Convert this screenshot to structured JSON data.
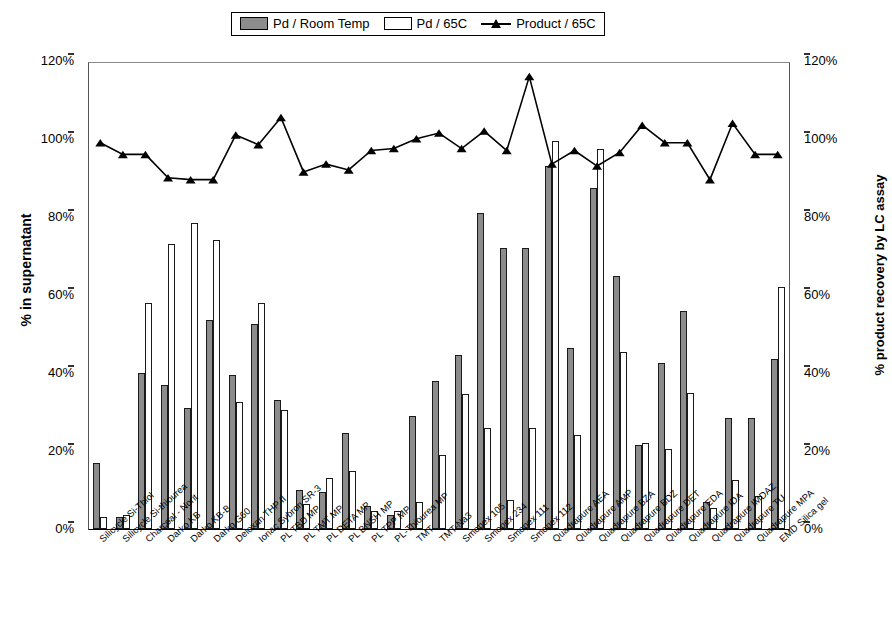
{
  "legend": {
    "items": [
      {
        "label": "Pd / Room Temp",
        "marker": "filled-bar-swatch",
        "color": "#8c8c8c"
      },
      {
        "label": "Pd / 65C",
        "marker": "empty-bar-swatch",
        "color": "#ffffff"
      },
      {
        "label": "Product / 65C",
        "marker": "line-triangle-marker",
        "color": "#000000"
      }
    ]
  },
  "axes": {
    "left_title": "% in supernatant",
    "right_title": "% product recovery by LC assay",
    "ticks": [
      "0%",
      "20%",
      "40%",
      "60%",
      "80%",
      "100%",
      "120%"
    ]
  },
  "chart_data": {
    "type": "bar",
    "title": "",
    "xlabel": "",
    "ylabel": "% in supernatant",
    "ylabel_secondary": "% product recovery by LC assay",
    "ylim": [
      0,
      120
    ],
    "ylim_secondary": [
      0,
      120
    ],
    "grid": false,
    "legend_position": "top-center",
    "categories": [
      "Silicycle Si-Thiol",
      "Silicycle Si-thiourea",
      "Charcoal - Norit",
      "Darko KB",
      "Darko KB-B",
      "Darko G60",
      "Deloxan THP II",
      "Ionac Sybron SR-3",
      "PL TBD MP",
      "PL TMT MP",
      "PL DETA MP",
      "PL BNSH MP",
      "PL TPP MP",
      "PL-Thiourea MP",
      "TMT",
      "TMT-Na3",
      "Smopex 105",
      "Smopex 234",
      "Smopex 111",
      "Smopex 112",
      "Quadrapure AEA",
      "Quadrapure AMP",
      "Quadrapure BZA",
      "Quadrapure BDZ",
      "Quadrapure DET",
      "Quadrapure EDA",
      "Quadrapure IDA",
      "Quadrapure IMDAZ",
      "Quadrapure TU",
      "Quadrapure MPA",
      "EMD Silica gel"
    ],
    "series": [
      {
        "name": "Pd / Room Temp",
        "type": "bar",
        "axis": "left",
        "color": "#8c8c8c",
        "values": [
          17,
          3,
          40,
          37,
          31,
          53.5,
          39.5,
          52.5,
          33,
          10,
          9.5,
          24.5,
          6,
          3.5,
          29,
          38,
          44.5,
          81,
          72,
          72,
          93,
          46.5,
          87.5,
          65,
          21.5,
          42.5,
          56,
          7,
          28.5,
          28.5,
          43.5
        ]
      },
      {
        "name": "Pd / 65C",
        "type": "bar",
        "axis": "left",
        "color": "#ffffff",
        "values": [
          3,
          3.5,
          58,
          73,
          78.5,
          74,
          32.5,
          58,
          30.5,
          6.5,
          13,
          15,
          4.5,
          4.5,
          7,
          19,
          34.5,
          26,
          7.5,
          26,
          99.5,
          24,
          97.5,
          45.5,
          22,
          20.5,
          35,
          5.5,
          12.5,
          8.5,
          62
        ]
      },
      {
        "name": "Product / 65C",
        "type": "line",
        "axis": "right",
        "color": "#000000",
        "marker": "triangle",
        "values": [
          99.5,
          96.5,
          96.5,
          90.5,
          90,
          90,
          101.5,
          99,
          106,
          92,
          94,
          92.5,
          97.5,
          98,
          100.5,
          102,
          98,
          102.5,
          97.5,
          116.5,
          94,
          97.5,
          93.5,
          97,
          104,
          99.5,
          99.5,
          90,
          104.5,
          96.5,
          96.5
        ]
      }
    ]
  }
}
